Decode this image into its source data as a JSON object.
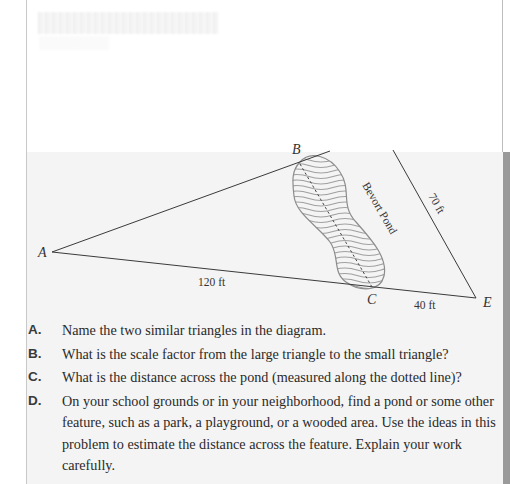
{
  "document": {
    "type": "textbook-page",
    "header_blurred": true
  },
  "diagram": {
    "vertices": {
      "A": {
        "label": "A",
        "x": 52,
        "y": 252
      },
      "B": {
        "label": "B",
        "x": 300,
        "y": 164
      },
      "C": {
        "label": "C",
        "x": 372,
        "y": 287
      },
      "D": {
        "label": "D",
        "x": 393,
        "y": 150
      },
      "E": {
        "label": "E",
        "x": 476,
        "y": 298
      }
    },
    "measurements": {
      "AC": "120 ft",
      "CE": "40 ft",
      "DE": "70 ft"
    },
    "pond_label": "Bevort Pond",
    "colors": {
      "line": "#3a3a3a",
      "pond_hatch": "#9e9e9e",
      "pond_outline": "#8c8c8c"
    }
  },
  "questions": [
    {
      "label": "A.",
      "text": "Name the two similar triangles in the diagram."
    },
    {
      "label": "B.",
      "text": "What is the scale factor from the large triangle to the small triangle?"
    },
    {
      "label": "C.",
      "text": "What is the distance across the pond (measured along the dotted line)?"
    },
    {
      "label": "D.",
      "text": "On your school grounds or in your neighborhood, find a pond or some other feature, such as a park, a playground, or a wooded area. Use the ideas in this problem to estimate the distance across the feature. Explain your work carefully."
    }
  ]
}
